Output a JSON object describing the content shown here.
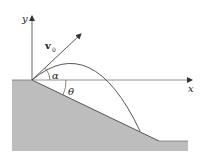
{
  "diagram": {
    "type": "projectile-on-inclined-slope",
    "labels": {
      "y_axis": "y",
      "x_axis": "x",
      "velocity": "v",
      "velocity_sub": "0",
      "launch_angle": "α",
      "slope_angle": "θ"
    },
    "colors": {
      "ground_fill": "#bdbdbd",
      "line": "#444444",
      "axis": "#555555",
      "background": "#ffffff"
    }
  }
}
